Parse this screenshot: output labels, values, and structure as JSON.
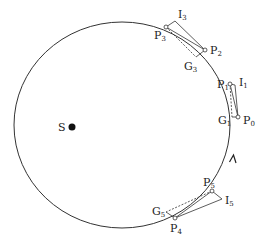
{
  "diagram": {
    "type": "orbit-construction",
    "orbit": {
      "cx": 122,
      "cy": 125,
      "rx": 108,
      "ry": 103,
      "stroke": "#333333"
    },
    "sun": {
      "label": "S",
      "x": 72,
      "y": 127
    },
    "points": {
      "P0": {
        "main": "P",
        "sub": "0",
        "x": 238,
        "y": 117
      },
      "P1": {
        "main": "P",
        "sub": "1",
        "x": 230,
        "y": 84
      },
      "P2": {
        "main": "P",
        "sub": "2",
        "x": 205,
        "y": 50
      },
      "P3": {
        "main": "P",
        "sub": "3",
        "x": 166,
        "y": 27
      },
      "P4": {
        "main": "P",
        "sub": "4",
        "x": 175,
        "y": 218
      },
      "P5": {
        "main": "P",
        "sub": "5",
        "x": 212,
        "y": 191
      }
    },
    "construction": {
      "I1": {
        "main": "I",
        "sub": "1",
        "x": 235,
        "y": 85
      },
      "G1": {
        "main": "G",
        "sub": "1",
        "x": 234,
        "y": 117
      },
      "I3": {
        "main": "I",
        "sub": "3",
        "x": 175,
        "y": 20
      },
      "G3": {
        "main": "G",
        "sub": "3",
        "x": 196,
        "y": 57
      },
      "I5": {
        "main": "I",
        "sub": "5",
        "x": 222,
        "y": 200
      },
      "G5": {
        "main": "G",
        "sub": "5",
        "x": 166,
        "y": 213
      }
    },
    "direction_arrow": {
      "x": 233,
      "y": 157,
      "direction": "counterclockwise"
    }
  }
}
